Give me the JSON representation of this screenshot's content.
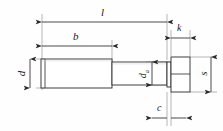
{
  "drawing": {
    "title": "Hexagon head bolt dimension diagram",
    "type": "engineering-dimension-drawing",
    "canvas": {
      "width": 223,
      "height": 131,
      "background": "#fefefe"
    },
    "style": {
      "line_color": "#2a2a2a",
      "dimension_color": "#2a2a2a",
      "extension_color": "#8f8f8f",
      "shade_color": "#d9d9d9",
      "line_width": 0.8
    },
    "part": {
      "name": "hex-head-bolt",
      "thread_section": {
        "x1": 41,
        "x2": 112,
        "y1": 59,
        "y2": 88
      },
      "shank_section": {
        "x1": 112,
        "x2": 167,
        "y1": 62,
        "y2": 85
      },
      "head": {
        "x1": 171,
        "x2": 190,
        "y1": 57,
        "y2": 92,
        "midline_y": 74
      },
      "washer_face": {
        "x1": 167,
        "x2": 171,
        "y1": 62,
        "y2": 87
      }
    },
    "dimensions": [
      {
        "id": "l",
        "label": "l",
        "sub": "",
        "orientation": "horizontal",
        "description": "overall-length",
        "line_y": 22,
        "x1": 42,
        "x2": 167,
        "label_x": 101,
        "label_y": 7,
        "font_size": 11
      },
      {
        "id": "b",
        "label": "b",
        "sub": "",
        "orientation": "horizontal",
        "description": "thread-length",
        "line_y": 46,
        "x1": 42,
        "x2": 112,
        "label_x": 73,
        "label_y": 31,
        "font_size": 11
      },
      {
        "id": "k",
        "label": "k",
        "sub": "",
        "orientation": "horizontal",
        "description": "head-height",
        "line_y": 38,
        "x1": 171,
        "x2": 190,
        "label_x": 177,
        "label_y": 23,
        "font_size": 10
      },
      {
        "id": "d",
        "label": "d",
        "sub": "",
        "orientation": "vertical",
        "description": "thread-diameter",
        "line_x": 30,
        "y1": 59,
        "y2": 88,
        "label_x": 19,
        "label_y": 68,
        "font_size": 11
      },
      {
        "id": "da",
        "label": "d",
        "sub": "a",
        "orientation": "vertical",
        "description": "shank-diameter",
        "line_x": 152,
        "y1": 62,
        "y2": 85,
        "label_x": 142,
        "label_y": 68,
        "font_size": 10
      },
      {
        "id": "s",
        "label": "s",
        "sub": "",
        "orientation": "vertical",
        "description": "width-across-flats",
        "line_x": 211,
        "y1": 57,
        "y2": 92,
        "label_x": 201,
        "label_y": 68,
        "font_size": 11
      },
      {
        "id": "c",
        "label": "c",
        "sub": "",
        "orientation": "horizontal-outward",
        "description": "washer-face-thickness",
        "line_y": 118,
        "x1": 167,
        "x2": 171,
        "label_x": 157,
        "label_y": 103,
        "font_size": 10
      }
    ]
  }
}
